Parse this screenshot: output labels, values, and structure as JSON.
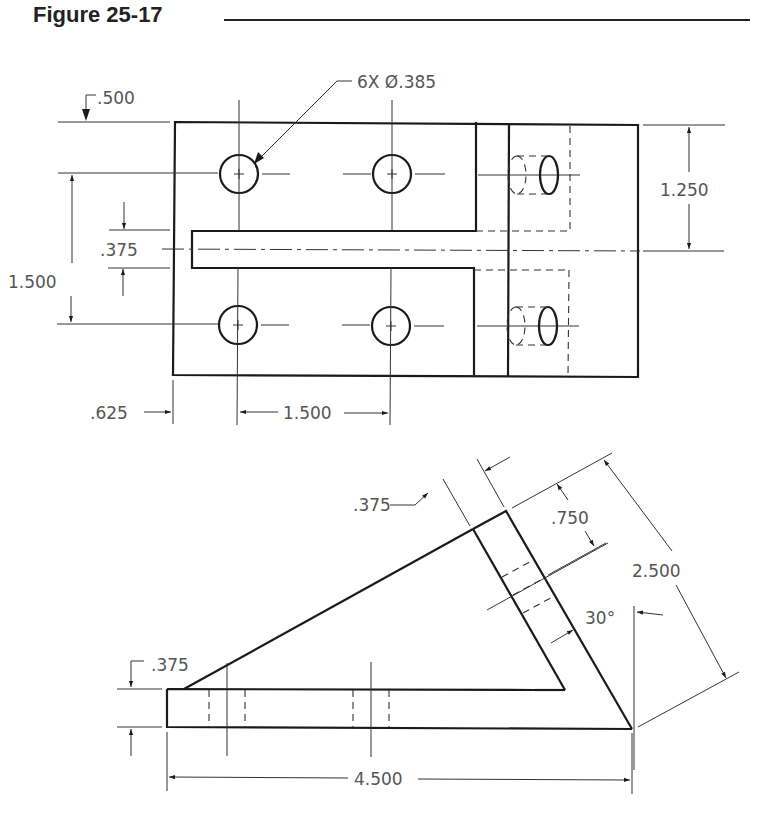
{
  "figure": {
    "title": "Figure 25-17"
  },
  "top_view": {
    "dimensions": {
      "hole_callout": "6X Ø.385",
      "edge_to_hole_vertical": ".500",
      "hole_to_centerline": "1.250",
      "slot_width": ".375",
      "hole_spacing_vertical": "1.500",
      "edge_to_hole_horizontal": ".625",
      "hole_spacing_horizontal": "1.500"
    }
  },
  "side_view": {
    "dimensions": {
      "upright_thickness": ".375",
      "hole_offset": ".750",
      "upright_length": "2.500",
      "angle": "30°",
      "base_thickness": ".375",
      "overall_length": "4.500"
    }
  }
}
